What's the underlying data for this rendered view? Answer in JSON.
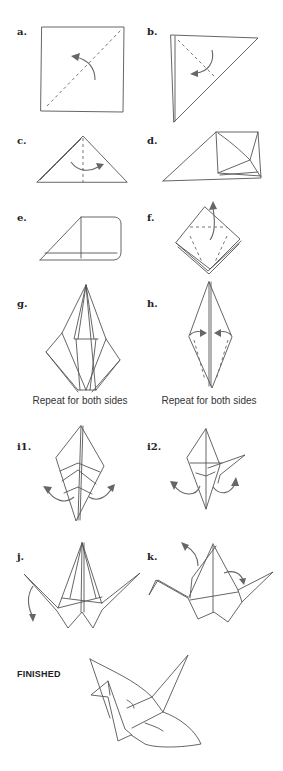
{
  "colors": {
    "line": "#555555",
    "arrow": "#666666",
    "text": "#222222",
    "background": "#ffffff"
  },
  "steps": [
    {
      "id": "a",
      "label": "a."
    },
    {
      "id": "b",
      "label": "b."
    },
    {
      "id": "c",
      "label": "c."
    },
    {
      "id": "d",
      "label": "d."
    },
    {
      "id": "e",
      "label": "e."
    },
    {
      "id": "f",
      "label": "f."
    },
    {
      "id": "g",
      "label": "g.",
      "caption": "Repeat for both sides"
    },
    {
      "id": "h",
      "label": "h.",
      "caption": "Repeat for both sides"
    },
    {
      "id": "i1",
      "label": "i1."
    },
    {
      "id": "i2",
      "label": "i2."
    },
    {
      "id": "j",
      "label": "j."
    },
    {
      "id": "k",
      "label": "k."
    }
  ],
  "finished": {
    "label": "FINISHED"
  }
}
